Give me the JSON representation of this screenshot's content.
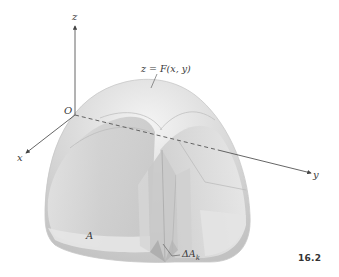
{
  "figure": {
    "number": "16.2",
    "surface_label": "z = F(x, y)",
    "origin_label": "O",
    "region_label": "A",
    "element_label_base": "ΔA",
    "element_label_sub": "k"
  },
  "axes": {
    "z": {
      "label": "z"
    },
    "x": {
      "label": "x"
    },
    "y": {
      "label": "y"
    }
  },
  "colors": {
    "background": "#ffffff",
    "axis": "#555555",
    "surface_light": "#eeeeee",
    "surface_mid": "#d2d2d2",
    "surface_dark": "#b8b8b8",
    "text": "#3a3a3a"
  }
}
